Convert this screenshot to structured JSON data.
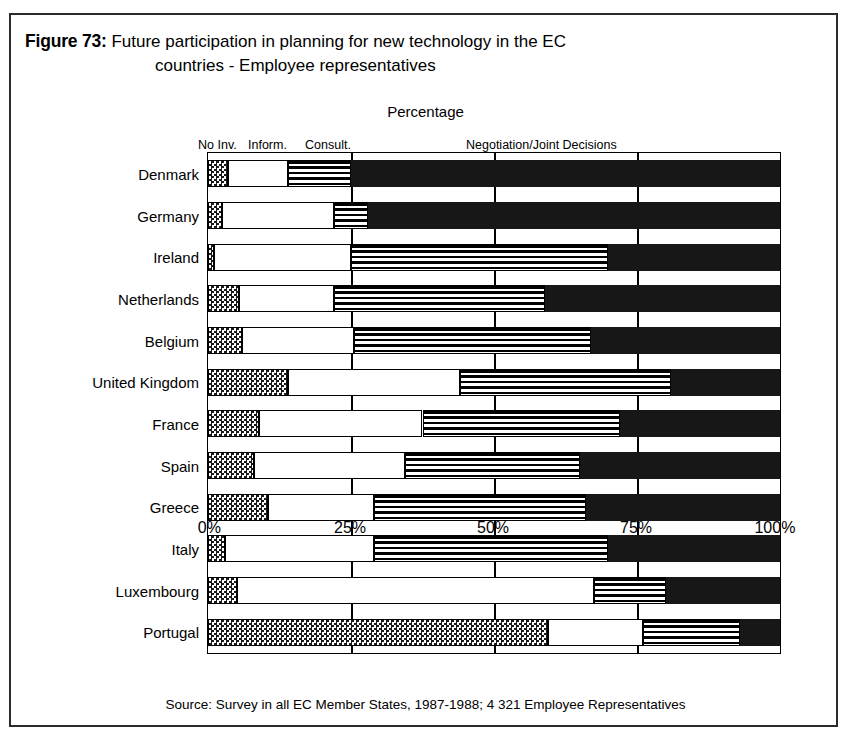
{
  "figure": {
    "label": "Figure 73:",
    "title_line1": "Future participation in planning for new technology in the EC",
    "title_line2": "countries - Employee representatives",
    "axis_caption": "Percentage",
    "source": "Source: Survey in all EC Member States, 1987-1988; 4 321 Employee Representatives"
  },
  "legend": {
    "no_inv": "No Inv.",
    "inform": "Inform.",
    "consult": "Consult.",
    "negotiation": "Negotiation/Joint Decisions"
  },
  "axis": {
    "ticks": [
      "0%",
      "25%",
      "50%",
      "75%",
      "100%"
    ]
  },
  "chart_data": {
    "type": "bar",
    "orientation": "horizontal",
    "stacked": true,
    "normalized_percent": true,
    "title": "Future participation in planning for new technology in the EC countries - Employee representatives",
    "subtitle": "Percentage",
    "xlabel": "Percentage",
    "ylabel": "",
    "xlim": [
      0,
      100
    ],
    "xticks": [
      0,
      25,
      50,
      75,
      100
    ],
    "grid": true,
    "legend_position": "top",
    "source": "Source: Survey in all EC Member States, 1987-1988; 4 321 Employee Representatives",
    "categories": [
      "Denmark",
      "Germany",
      "Ireland",
      "Netherlands",
      "Belgium",
      "United Kingdom",
      "France",
      "Spain",
      "Greece",
      "Italy",
      "Luxembourg",
      "Portugal"
    ],
    "series": [
      {
        "name": "No Inv.",
        "pattern": "checkerboard",
        "color": "#808080",
        "values": [
          3.5,
          2.5,
          1.0,
          5.5,
          6.0,
          14.0,
          9.0,
          8.0,
          10.5,
          3.0,
          5.0,
          59.5
        ]
      },
      {
        "name": "Inform.",
        "pattern": "white",
        "color": "#ffffff",
        "values": [
          10.5,
          19.5,
          24.0,
          16.5,
          19.5,
          30.0,
          28.5,
          26.5,
          18.5,
          26.0,
          62.5,
          16.5
        ]
      },
      {
        "name": "Consult.",
        "pattern": "horizontal-stripes",
        "color": "#4d4d4d",
        "values": [
          11.0,
          6.0,
          45.0,
          37.0,
          41.5,
          37.0,
          34.5,
          30.5,
          37.0,
          41.0,
          12.5,
          17.0
        ]
      },
      {
        "name": "Negotiation/Joint Decisions",
        "pattern": "solid-black",
        "color": "#171717",
        "values": [
          75.0,
          72.0,
          30.0,
          41.0,
          33.0,
          19.0,
          28.0,
          35.0,
          34.0,
          30.0,
          20.0,
          7.0
        ]
      }
    ]
  }
}
